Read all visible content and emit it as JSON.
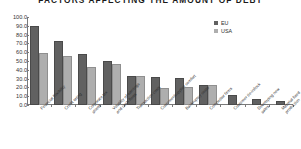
{
  "chart_data": {
    "type": "bar",
    "title": "FACTORS AFFECTING THE AMOUNT OF DEBT",
    "xlabel": "",
    "ylabel": "",
    "ylim": [
      0,
      100
    ],
    "ytick_step": 10,
    "ytick_labels": [
      "100.0",
      "90.0",
      "80.0",
      "70.0",
      "60.0",
      "50.0",
      "40.0",
      "30.0",
      "20.0",
      "10.0",
      "0.0"
    ],
    "grid": false,
    "legend_position": "top-right",
    "categories": [
      "Financial flexibility",
      "Credit rating",
      "Corporate tax shield",
      "Volatility of earnings and cash flows",
      "Transaction costs",
      "Customer/supplier comfort",
      "Bankruptcy costs",
      "Competitor firms",
      "Customer tie-in/lock",
      "Developing new sales",
      "Material fixed production"
    ],
    "series": [
      {
        "name": "EU",
        "color": "#616161",
        "values": [
          90,
          73,
          58,
          50,
          33,
          32,
          31,
          23,
          11,
          7,
          4
        ]
      },
      {
        "name": "USA",
        "color": "#aeaeae",
        "values": [
          59,
          56,
          43,
          47,
          33,
          19,
          21,
          23,
          null,
          null,
          null
        ]
      }
    ]
  },
  "legend": {
    "items": [
      {
        "label": "EU"
      },
      {
        "label": "USA"
      }
    ]
  }
}
